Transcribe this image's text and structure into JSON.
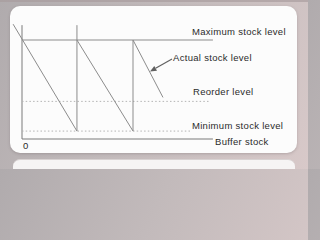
{
  "figure": {
    "colors": {
      "line": "#8c8c8c",
      "axis": "#7a7a7a",
      "dotted": "#b4b4b4",
      "arrow": "#606060",
      "text": "#2b2b2b",
      "card_bg": "#fcfcfc",
      "page_bg": "#c2babb"
    }
  },
  "chart_data": {
    "type": "line",
    "title": "",
    "xlabel": "",
    "ylabel": "",
    "origin": "0",
    "ylim": [
      0,
      120
    ],
    "grid": false,
    "legend": "labels at right of lines",
    "levels": [
      {
        "label": "Maximum stock level",
        "value": 100,
        "style": "solid",
        "t_end": 3.44
      },
      {
        "label": "Reorder level",
        "value": 38,
        "style": "dotted",
        "t_end": 3.4
      },
      {
        "label": "Minimum stock level",
        "value": 8,
        "style": "dotted",
        "t_end": 3.03
      }
    ],
    "axes": {
      "y_axis_top": 115,
      "x_axis_end": 3.44,
      "x_axis_label": "Buffer stock"
    },
    "series": [
      {
        "name": "Actual stock level",
        "segments": [
          [
            [
              -0.16,
              116
            ],
            [
              0.99,
              8
            ]
          ],
          [
            [
              0.99,
              8
            ],
            [
              0.99,
              115
            ]
          ],
          [
            [
              0.99,
              100
            ],
            [
              2.0,
              8
            ]
          ],
          [
            [
              2.0,
              8
            ],
            [
              2.0,
              100
            ]
          ],
          [
            [
              2.0,
              100
            ],
            [
              2.54,
              42
            ]
          ]
        ]
      }
    ]
  }
}
